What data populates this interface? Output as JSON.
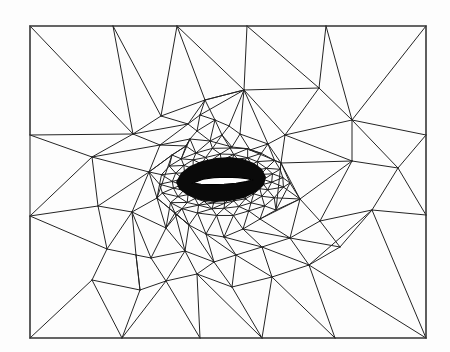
{
  "figure": {
    "kind": "mesh-plot",
    "background_color": "#fdfdfd",
    "line_color": "#242424",
    "airfoil_color": "#000000",
    "width": 450,
    "height": 352
  },
  "chart_data": {
    "type": "mesh",
    "xlabel": "",
    "ylabel": "",
    "xlim": [
      30,
      426
    ],
    "ylim": [
      26,
      338
    ],
    "grid": false,
    "legend": null,
    "domain": {
      "name": "rectangular-far-field",
      "corners": [
        [
          30,
          26
        ],
        [
          426,
          26
        ],
        [
          426,
          338
        ],
        [
          30,
          338
        ]
      ]
    },
    "airfoil": {
      "name": "airfoil-slit",
      "chord_start": [
        193,
        183
      ],
      "chord_end": [
        252,
        180
      ],
      "thickness_px": 5,
      "outline": [
        [
          193,
          183
        ],
        [
          203,
          179.2
        ],
        [
          214,
          177.6
        ],
        [
          226,
          177.2
        ],
        [
          238,
          177.6
        ],
        [
          247,
          178.6
        ],
        [
          252,
          180
        ],
        [
          246,
          181.6
        ],
        [
          236,
          183.2
        ],
        [
          224,
          184.2
        ],
        [
          212,
          184.6
        ],
        [
          201,
          184.2
        ]
      ],
      "refinement_halo": [
        [
          176,
          182
        ],
        [
          181,
          173
        ],
        [
          190,
          166
        ],
        [
          202,
          161
        ],
        [
          216,
          158
        ],
        [
          230,
          157
        ],
        [
          243,
          159
        ],
        [
          254,
          163
        ],
        [
          262,
          169
        ],
        [
          266,
          177
        ],
        [
          264,
          185
        ],
        [
          256,
          192
        ],
        [
          244,
          198
        ],
        [
          230,
          201
        ],
        [
          215,
          202
        ],
        [
          200,
          200
        ],
        [
          187,
          195
        ],
        [
          179,
          189
        ]
      ]
    },
    "boundary_nodes": {
      "top": [
        [
          30,
          26
        ],
        [
          113,
          26
        ],
        [
          177,
          26
        ],
        [
          247,
          26
        ],
        [
          326,
          26
        ],
        [
          426,
          26
        ]
      ],
      "bottom": [
        [
          30,
          338
        ],
        [
          122,
          338
        ],
        [
          200,
          338
        ],
        [
          262,
          338
        ],
        [
          335,
          338
        ],
        [
          426,
          338
        ]
      ],
      "left": [
        [
          30,
          26
        ],
        [
          30,
          135
        ],
        [
          30,
          216
        ],
        [
          30,
          338
        ]
      ],
      "right": [
        [
          426,
          26
        ],
        [
          426,
          135
        ],
        [
          426,
          215
        ],
        [
          426,
          338
        ]
      ]
    },
    "nodes": [
      [
        30,
        26
      ],
      [
        113,
        26
      ],
      [
        177,
        26
      ],
      [
        247,
        26
      ],
      [
        326,
        26
      ],
      [
        426,
        26
      ],
      [
        30,
        135
      ],
      [
        30,
        216
      ],
      [
        30,
        338
      ],
      [
        426,
        135
      ],
      [
        426,
        215
      ],
      [
        426,
        338
      ],
      [
        122,
        338
      ],
      [
        200,
        338
      ],
      [
        262,
        338
      ],
      [
        335,
        338
      ],
      [
        133,
        134
      ],
      [
        161,
        116
      ],
      [
        188,
        124
      ],
      [
        205,
        100
      ],
      [
        244,
        90
      ],
      [
        285,
        135
      ],
      [
        319,
        88
      ],
      [
        352,
        161
      ],
      [
        92,
        157
      ],
      [
        98,
        206
      ],
      [
        149,
        172
      ],
      [
        157,
        198
      ],
      [
        160,
        145
      ],
      [
        172,
        155
      ],
      [
        186,
        146
      ],
      [
        190,
        139
      ],
      [
        197,
        131
      ],
      [
        210,
        141
      ],
      [
        222,
        135
      ],
      [
        232,
        147
      ],
      [
        240,
        134
      ],
      [
        229,
        126
      ],
      [
        215,
        120
      ],
      [
        200,
        115
      ],
      [
        250,
        150
      ],
      [
        268,
        144
      ],
      [
        281,
        163
      ],
      [
        290,
        183
      ],
      [
        300,
        199
      ],
      [
        276,
        210
      ],
      [
        260,
        219
      ],
      [
        243,
        229
      ],
      [
        224,
        237
      ],
      [
        206,
        234
      ],
      [
        189,
        225
      ],
      [
        175,
        213
      ],
      [
        166,
        228
      ],
      [
        150,
        243
      ],
      [
        136,
        255
      ],
      [
        119,
        262
      ],
      [
        107,
        249
      ],
      [
        132,
        212
      ],
      [
        151,
        258
      ],
      [
        185,
        251
      ],
      [
        214,
        262
      ],
      [
        236,
        255
      ],
      [
        262,
        247
      ],
      [
        290,
        238
      ],
      [
        320,
        221
      ],
      [
        340,
        247
      ],
      [
        372,
        210
      ],
      [
        398,
        168
      ],
      [
        352,
        120
      ],
      [
        309,
        265
      ],
      [
        272,
        277
      ],
      [
        232,
        287
      ],
      [
        197,
        274
      ],
      [
        166,
        281
      ],
      [
        140,
        290
      ],
      [
        92,
        280
      ]
    ],
    "counts": {
      "approx_triangles": "~320",
      "approx_nodes": "~190"
    }
  }
}
